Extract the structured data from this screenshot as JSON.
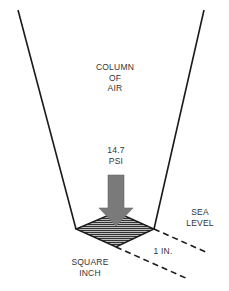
{
  "diagram": {
    "labels": {
      "column": [
        "COLUMN",
        "OF",
        "AIR"
      ],
      "pressure": [
        "14.7",
        "PSI"
      ],
      "sea_level": [
        "SEA",
        "LEVEL"
      ],
      "dimension": "1 IN.",
      "square_inch": [
        "SQUARE",
        "INCH"
      ]
    },
    "colors": {
      "line": "#1a1a1a",
      "arrow": "#7a7a7a",
      "hatch_fill": "#8c8c8c",
      "text": "#333333",
      "background": "#ffffff"
    }
  }
}
